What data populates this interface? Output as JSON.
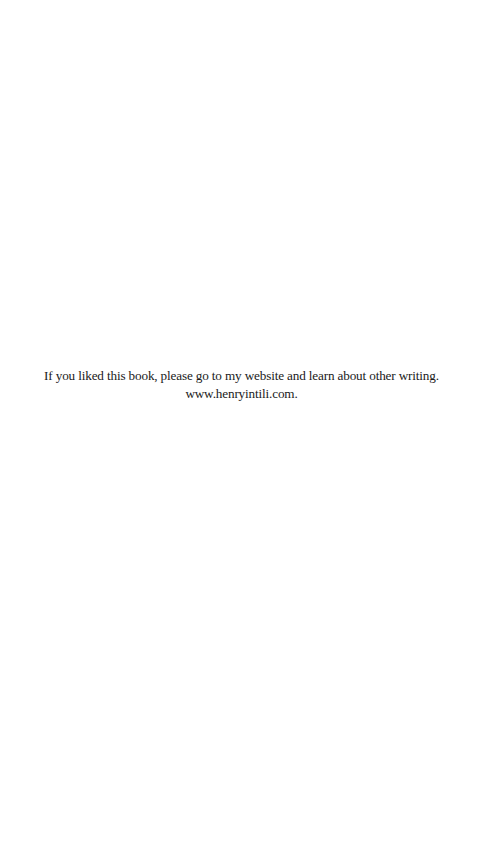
{
  "page": {
    "message_line": "If you liked this book, please go to my website and learn about other writing.",
    "website_line": "www.henryintili.com."
  }
}
